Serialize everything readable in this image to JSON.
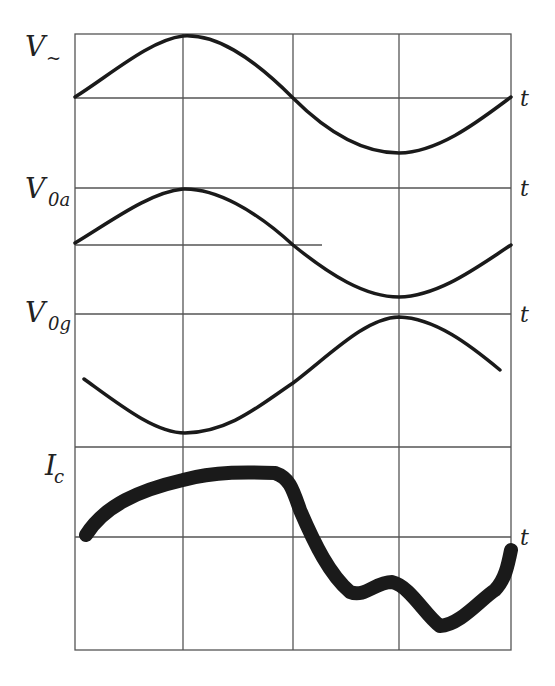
{
  "figure": {
    "type": "oscilloscope-waveform-diagram",
    "grid": {
      "columns": 4,
      "vertical_lines_x": [
        75,
        183,
        293,
        399,
        511
      ],
      "top": 34,
      "bottom": 650
    },
    "traces": [
      {
        "id": "v_ac",
        "label_main": "V",
        "label_sub": "~",
        "axis_label": "t",
        "top_line_y": 34,
        "baseline_y": 98,
        "description": "sine wave starting at zero, peak at first gridline, trough at third gridline"
      },
      {
        "id": "v_0a",
        "label_main": "V",
        "label_sub": "0a",
        "axis_label": "t",
        "top_line_y": 188,
        "baseline_y": 245,
        "description": "sine wave in phase with V~"
      },
      {
        "id": "v_0g",
        "label_main": "V",
        "label_sub": "0g",
        "axis_label": "t",
        "top_line_y": 314,
        "description": "inverted sine wave, trough at first gridline, peak at third gridline"
      },
      {
        "id": "i_c",
        "label_main": "I",
        "label_sub": "c",
        "axis_label": "t",
        "top_line_y": 447,
        "baseline_y": 537,
        "description": "thick distorted current trace with flattened top and dip near third gridline"
      }
    ]
  }
}
